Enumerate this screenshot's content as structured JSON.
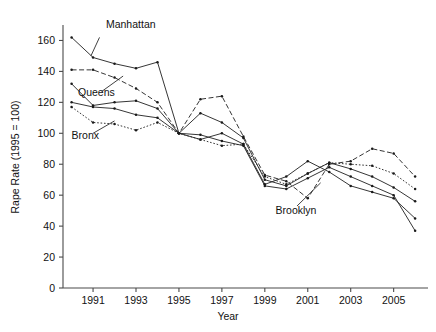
{
  "chart_data": {
    "type": "line",
    "title": "",
    "xlabel": "Year",
    "ylabel": "Rape Rate (1995 = 100)",
    "xlim": [
      1989.6,
      2006.6
    ],
    "ylim": [
      0,
      170
    ],
    "xticks": [
      1991,
      1993,
      1995,
      1997,
      1999,
      2001,
      2003,
      2005
    ],
    "xtick_labels": [
      "1991",
      "1993",
      "1995",
      "1997",
      "1999",
      "2001",
      "2003",
      "2005"
    ],
    "yticks": [
      0,
      20,
      40,
      60,
      80,
      100,
      120,
      140,
      160
    ],
    "ytick_labels": [
      "0",
      "20",
      "40",
      "60",
      "80",
      "100",
      "120",
      "140",
      "160"
    ],
    "grid": false,
    "legend_position": "inline-annotations",
    "x": [
      1990,
      1991,
      1992,
      1993,
      1994,
      1995,
      1996,
      1997,
      1998,
      1999,
      2000,
      2001,
      2002,
      2003,
      2004,
      2005,
      2006
    ],
    "series": [
      {
        "name": "Manhattan",
        "line_style": "solid",
        "marker": "dot",
        "values": [
          162,
          149,
          145,
          142,
          146,
          100,
          96,
          100,
          93,
          67,
          72,
          82,
          75,
          66,
          62,
          58,
          45
        ],
        "label_x": 1991.6,
        "label_y": 168,
        "leader_from": [
          1991.3,
          162
        ],
        "leader_to": [
          1990.9,
          150
        ]
      },
      {
        "name": "Queens",
        "line_style": "dashed",
        "marker": "dot",
        "values": [
          141,
          141,
          136,
          129,
          120,
          100,
          122,
          124,
          98,
          73,
          69,
          58,
          80,
          82,
          90,
          87,
          72
        ],
        "label_x": 1990.3,
        "label_y": 124,
        "leader_from": [
          1991.4,
          127
        ],
        "leader_to": [
          1992.4,
          137
        ]
      },
      {
        "name": "Bronx",
        "line_style": "solid",
        "marker": "dot",
        "values": [
          132,
          118,
          120,
          121,
          116,
          100,
          113,
          107,
          97,
          70,
          66,
          74,
          81,
          77,
          72,
          65,
          56
        ],
        "label_x": 1990.0,
        "label_y": 96,
        "leader_from": [
          1991.0,
          100
        ],
        "leader_to": [
          1992.0,
          108
        ]
      },
      {
        "name": "Brooklyn",
        "line_style": "dotted",
        "marker": "dot",
        "values": [
          117,
          107,
          106,
          102,
          107,
          100,
          96,
          92,
          93,
          72,
          67,
          74,
          81,
          80,
          79,
          74,
          64
        ],
        "label_x": 1999.5,
        "label_y": 48,
        "leader_from": [
          2000.5,
          53
        ],
        "leader_to": [
          2001.6,
          68
        ]
      },
      {
        "name": "series-5",
        "line_style": "solid",
        "marker": "dot",
        "values": [
          120,
          117,
          116,
          112,
          110,
          100,
          99,
          95,
          92,
          66,
          64,
          71,
          78,
          72,
          66,
          60,
          37
        ],
        "label_x": null,
        "label_y": null
      }
    ],
    "annotations": [
      {
        "text": "Manhattan"
      },
      {
        "text": "Queens"
      },
      {
        "text": "Bronx"
      },
      {
        "text": "Brooklyn"
      }
    ]
  },
  "axis": {
    "x_title": "Year",
    "y_title": "Rape Rate (1995 = 100)"
  },
  "colors": {
    "line": "#2b2b2b",
    "axis": "#4a4a4a",
    "text": "#111111",
    "background": "#ffffff"
  }
}
